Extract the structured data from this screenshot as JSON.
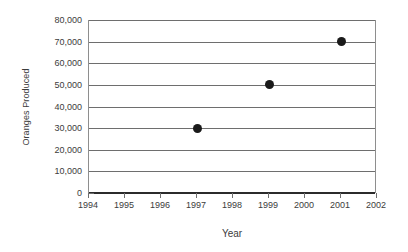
{
  "chart_data": {
    "type": "scatter",
    "title": "",
    "xlabel": "Year",
    "ylabel": "Oranges Produced",
    "xlim": [
      1994,
      2002
    ],
    "ylim": [
      0,
      80000
    ],
    "grid": "horizontal",
    "legend": "none",
    "x_tick_labels": [
      "1994",
      "1995",
      "1996",
      "1997",
      "1998",
      "1999",
      "2000",
      "2001",
      "2002"
    ],
    "x_ticks": [
      1994,
      1995,
      1996,
      1997,
      1998,
      1999,
      2000,
      2001,
      2002
    ],
    "y_tick_labels": [
      "0",
      "10,000",
      "20,000",
      "30,000",
      "40,000",
      "50,000",
      "60,000",
      "70,000",
      "80,000"
    ],
    "y_ticks": [
      0,
      10000,
      20000,
      30000,
      40000,
      50000,
      60000,
      70000,
      80000
    ],
    "points": [
      {
        "x": 1997,
        "y": 30000,
        "label": "1997: 30,000"
      },
      {
        "x": 1999,
        "y": 50000,
        "label": "1999: 50,000"
      },
      {
        "x": 2001,
        "y": 70000,
        "label": "2001: 70,000"
      }
    ],
    "marker_color": "#1a1a1a",
    "gridline_color": "#6e6e6e",
    "axis_color": "#2b2b2b",
    "text_color": "#3c3c3c",
    "background_color": "#ffffff"
  }
}
